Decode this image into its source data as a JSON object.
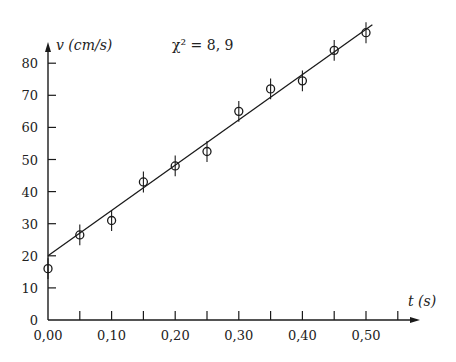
{
  "chart_data": {
    "type": "scatter",
    "title": "",
    "xlabel": "t (s)",
    "ylabel": "v (cm/s)",
    "annotation": "χ² = 8, 9",
    "xlim": [
      0,
      0.57
    ],
    "ylim": [
      0,
      90
    ],
    "x_ticks": [
      0.0,
      0.05,
      0.1,
      0.15,
      0.2,
      0.25,
      0.3,
      0.35,
      0.4,
      0.45,
      0.5,
      0.55
    ],
    "x_tick_labels": [
      "0,00",
      "0,10",
      "0,20",
      "0,30",
      "0,40",
      "0,50"
    ],
    "x_tick_label_values": [
      0.0,
      0.1,
      0.2,
      0.3,
      0.4,
      0.5
    ],
    "y_ticks": [
      0,
      10,
      20,
      30,
      40,
      50,
      60,
      70,
      80
    ],
    "y_tick_labels": [
      "0",
      "10",
      "20",
      "30",
      "40",
      "50",
      "60",
      "70",
      "80"
    ],
    "grid": false,
    "series": [
      {
        "name": "measurements",
        "marker": "open-circle",
        "x": [
          0.0,
          0.05,
          0.1,
          0.15,
          0.2,
          0.25,
          0.3,
          0.35,
          0.4,
          0.45,
          0.5
        ],
        "y": [
          16,
          26.5,
          31,
          43,
          48,
          52.5,
          65,
          72,
          74.5,
          84,
          89.5
        ],
        "y_error": [
          2,
          2,
          2,
          2,
          2,
          2,
          2,
          2,
          2,
          2,
          2
        ]
      },
      {
        "name": "linear fit",
        "type": "line",
        "x": [
          0.0,
          0.51
        ],
        "y": [
          20,
          92
        ]
      }
    ]
  },
  "colors": {
    "ink": "#1a1a1a",
    "background": "#ffffff"
  }
}
